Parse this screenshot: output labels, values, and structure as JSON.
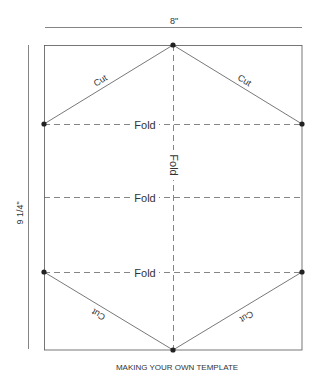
{
  "diagram": {
    "width_label": "8\"",
    "height_label": "9 1/4\"",
    "caption": "MAKING YOUR OWN TEMPLATE",
    "cut_labels": [
      "Cut",
      "Cut",
      "Cut",
      "Cut"
    ],
    "fold_labels": {
      "top": "Fold",
      "middle": "Fold",
      "bottom": "Fold",
      "vertical": "Fold"
    },
    "colors": {
      "line": "#555555",
      "dot": "#222222",
      "text": "#333333"
    }
  }
}
